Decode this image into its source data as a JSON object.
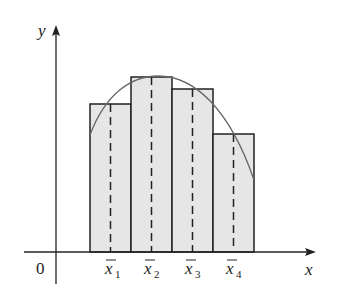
{
  "diagram": {
    "axes": {
      "x_label": "x",
      "y_label": "y",
      "origin_label": "0"
    },
    "sample_points": [
      {
        "label": "x",
        "subscript": "1"
      },
      {
        "label": "x",
        "subscript": "2"
      },
      {
        "label": "x",
        "subscript": "3"
      },
      {
        "label": "x",
        "subscript": "4"
      }
    ],
    "rectangles": [
      {
        "x": 90,
        "top": 104
      },
      {
        "x": 131,
        "top": 77
      },
      {
        "x": 172,
        "top": 89
      },
      {
        "x": 213,
        "top": 134
      }
    ],
    "colors": {
      "fill": "#e6e6e6",
      "stroke": "#222222",
      "curve": "#666666"
    }
  }
}
